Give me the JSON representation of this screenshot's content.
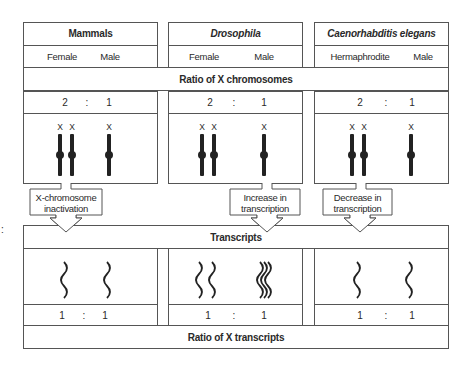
{
  "columns": [
    {
      "title": "Mammals",
      "italic": false,
      "left_label": "Female",
      "right_label": "Male",
      "ratio": {
        "left": "2",
        "sep": ":",
        "right": "1"
      },
      "transcript_ratio": {
        "left": "1",
        "sep": ":",
        "right": "1"
      },
      "mechanism": [
        "X-chromosome",
        "inactivation"
      ]
    },
    {
      "title": "Drosophila",
      "italic": true,
      "left_label": "Female",
      "right_label": "Male",
      "ratio": {
        "left": "2",
        "sep": ":",
        "right": "1"
      },
      "transcript_ratio": {
        "left": "1",
        "sep": ":",
        "right": "1"
      },
      "mechanism": [
        "Increase in",
        "transcription"
      ]
    },
    {
      "title": "Caenorhabditis elegans",
      "italic": true,
      "left_label": "Hermaphrodite",
      "right_label": "Male",
      "ratio": {
        "left": "2",
        "sep": ":",
        "right": "1"
      },
      "transcript_ratio": {
        "left": "1",
        "sep": ":",
        "right": "1"
      },
      "mechanism": [
        "Decrease in",
        "transcription"
      ]
    }
  ],
  "bands": {
    "x_ratio": "Ratio of X chromosomes",
    "transcripts": "Transcripts",
    "x_transcripts": "Ratio of X transcripts"
  },
  "chromosome_label": "X",
  "stray_mark": ":"
}
